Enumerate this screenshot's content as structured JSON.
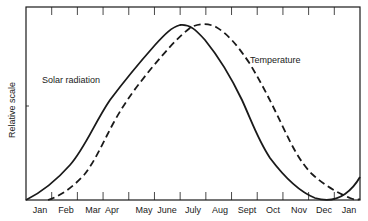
{
  "chart_data": {
    "type": "line",
    "title": "",
    "xlabel": "",
    "ylabel": "Relative scale",
    "categories": [
      "Jan",
      "Feb",
      "Mar",
      "Apr",
      "May",
      "June",
      "July",
      "Aug",
      "Sept",
      "Oct",
      "Nov",
      "Dec",
      "Jan"
    ],
    "series": [
      {
        "name": "Solar radiation",
        "style": "solid",
        "values": [
          0.02,
          0.22,
          0.52,
          0.78,
          0.95,
          1.0,
          0.93,
          0.65,
          0.32,
          0.1,
          0.0,
          0.02,
          0.12
        ]
      },
      {
        "name": "Temperature",
        "style": "dashed",
        "values": [
          0.0,
          0.05,
          0.3,
          0.58,
          0.8,
          0.95,
          1.0,
          0.9,
          0.65,
          0.38,
          0.17,
          0.06,
          0.0
        ]
      }
    ],
    "annotations": [
      "Solar radiation",
      "Temperature"
    ],
    "grid": false,
    "legend": "none (inline labels)",
    "ylim": [
      0,
      1
    ]
  },
  "labels": {
    "ylabel": "Relative scale",
    "solar": "Solar radiation",
    "temperature": "Temperature",
    "months": [
      "Jan",
      "Feb",
      "Mar",
      "Apr",
      "May",
      "June",
      "July",
      "Aug",
      "Sept",
      "Oct",
      "Nov",
      "Dec",
      "Jan"
    ]
  },
  "colors": {
    "line": "#1a1a1a",
    "background": "#ffffff"
  }
}
